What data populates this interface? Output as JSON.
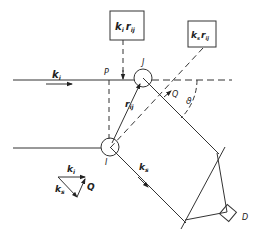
{
  "diagram": {
    "type": "scattering-geometry",
    "colors": {
      "stroke": "#333333",
      "background": "#ffffff"
    },
    "labels": {
      "incident_wavevector": "k",
      "incident_sub": "i",
      "scattered_wavevector": "k",
      "scattered_sub": "s",
      "point_P": "P",
      "atom_I": "I",
      "atom_J": "J",
      "point_Q": "Q",
      "separation_vector": "r",
      "separation_sub": "ij",
      "angle": "ϑ",
      "detector": "D",
      "scattering_vector": "Q",
      "box_incident_phase": {
        "k": "k",
        "k_sub": "i",
        "r": "r",
        "r_sub": "ij"
      },
      "box_scattered_phase": {
        "k": "k",
        "k_sub": "s",
        "r": "r",
        "r_sub": "ij"
      },
      "triangle": {
        "ki": "k",
        "ki_sub": "i",
        "ks": "k",
        "ks_sub": "s",
        "q": "Q"
      }
    }
  }
}
